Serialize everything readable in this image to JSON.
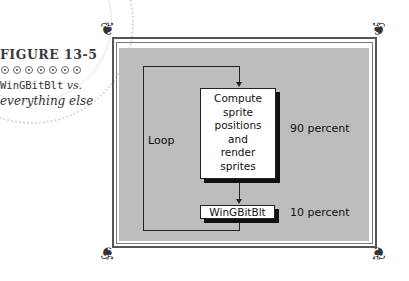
{
  "caption": {
    "figure_label": "FIGURE 13-5",
    "dots_count": 7,
    "title_mono": "WinGBitBlt",
    "title_rest": " vs.",
    "title_line2": "everything else"
  },
  "diagram": {
    "loop_label": "Loop",
    "compute_box": {
      "lines": [
        "Compute",
        "sprite",
        "positions",
        "and",
        "render",
        "sprites"
      ]
    },
    "wing_box": {
      "label": "WinGBitBlt"
    },
    "compute_share": "90 percent",
    "wing_share": "10 percent"
  },
  "colors": {
    "panel": "#bdbdbd",
    "frame": "#555555",
    "ink": "#111111"
  }
}
